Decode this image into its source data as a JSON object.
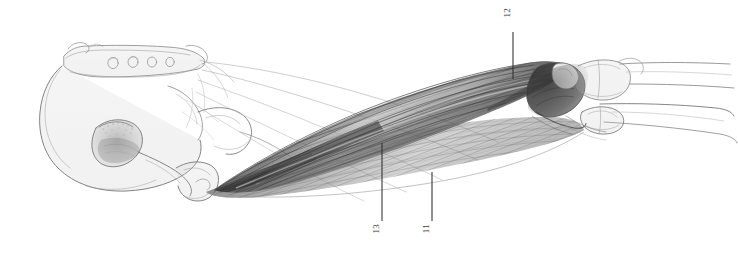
{
  "figure": {
    "kind": "anatomical-pencil-drawing",
    "background_color": "#ffffff",
    "ink_color": "#4a4a4a",
    "shading_color": "#5b5b5b",
    "width": 738,
    "height": 257
  },
  "labels": [
    {
      "id": "label-12",
      "text": "12",
      "text_x": 507,
      "text_y": 8,
      "leader": {
        "x1": 513,
        "y1": 32,
        "x2": 513,
        "y2": 79
      },
      "orientation": "vertical-rotated"
    },
    {
      "id": "label-13",
      "text": "13",
      "text_x": 376,
      "text_y": 224,
      "leader": {
        "x1": 382,
        "y1": 143,
        "x2": 382,
        "y2": 221
      },
      "orientation": "vertical-rotated"
    },
    {
      "id": "label-11",
      "text": "11",
      "text_x": 426,
      "text_y": 224,
      "leader": {
        "x1": 432,
        "y1": 172,
        "x2": 432,
        "y2": 221
      },
      "orientation": "vertical-rotated"
    }
  ],
  "structures": [
    {
      "name": "sacrum",
      "detail": "four sacral foramina"
    },
    {
      "name": "ilium"
    },
    {
      "name": "acetabulum-obturator-foramen"
    },
    {
      "name": "ischial-tuberosity"
    },
    {
      "name": "femur-shaft"
    },
    {
      "name": "femoral-condyles"
    },
    {
      "name": "tibia"
    },
    {
      "name": "fibula"
    },
    {
      "name": "hamstring-muscle-belly-upper"
    },
    {
      "name": "hamstring-muscle-belly-lower"
    },
    {
      "name": "fascia-lines"
    }
  ]
}
